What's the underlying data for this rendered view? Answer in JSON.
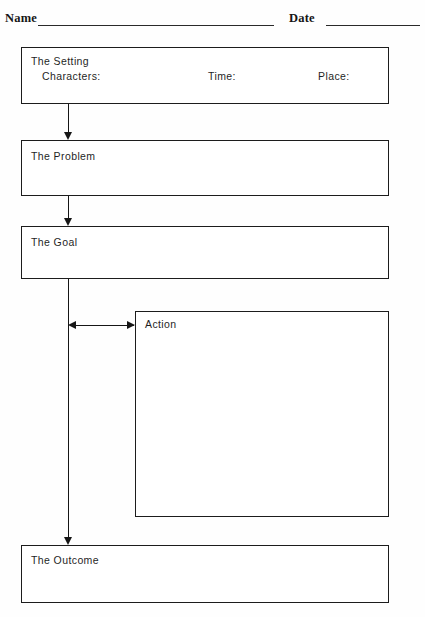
{
  "worksheet": {
    "header": {
      "name_label": "Name",
      "date_label": "Date"
    },
    "boxes": {
      "setting": {
        "title": "The Setting",
        "characters_label": "Characters:",
        "time_label": "Time:",
        "place_label": "Place:"
      },
      "problem": {
        "title": "The Problem"
      },
      "goal": {
        "title": "The Goal"
      },
      "action": {
        "title": "Action"
      },
      "outcome": {
        "title": "The Outcome"
      }
    },
    "connectors": [
      {
        "from": "setting",
        "to": "problem",
        "type": "arrow-down"
      },
      {
        "from": "problem",
        "to": "goal",
        "type": "arrow-down"
      },
      {
        "from": "goal",
        "to": "action",
        "type": "double-arrow-horizontal"
      },
      {
        "from": "goal",
        "to": "outcome",
        "type": "arrow-down"
      }
    ],
    "colors": {
      "ink": "#1c1c1c",
      "paper": "#ffffff"
    }
  }
}
